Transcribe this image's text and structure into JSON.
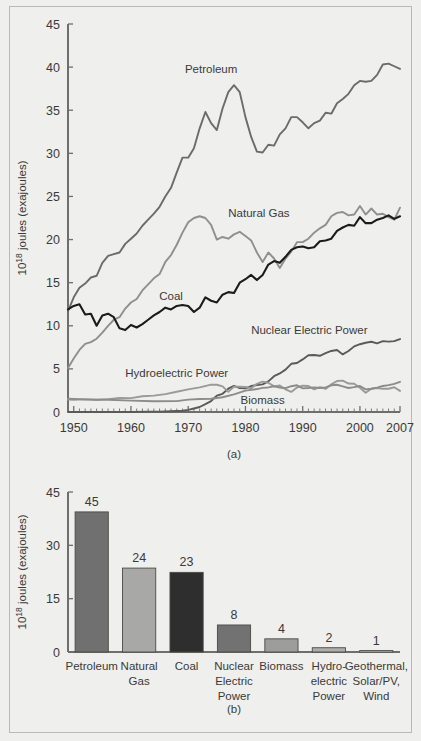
{
  "figure": {
    "background_color": "#efefed",
    "frame_color": "#b9b9b7",
    "text_color": "#3a3a38",
    "caption_a": "(a)",
    "caption_b": "(b)"
  },
  "chart_data": [
    {
      "type": "line",
      "panel": "(a)",
      "title": "",
      "xlabel": "",
      "ylabel": "10^18 joules (exajoules)",
      "ylabel_base": "10",
      "ylabel_exp": "18",
      "ylabel_rest": " joules (exajoules)",
      "xlim": [
        1949,
        2007
      ],
      "ylim": [
        0,
        45
      ],
      "yticks": [
        0,
        5,
        10,
        15,
        20,
        25,
        30,
        35,
        40,
        45
      ],
      "xticks": [
        1950,
        1960,
        1970,
        1980,
        1990,
        2000,
        2007
      ],
      "xtick_labels": [
        "1950",
        "1960",
        "1970",
        "1980",
        "1990",
        "2000",
        "2007"
      ],
      "x_minor_step": 1,
      "grid": false,
      "legend_position": "inline-annotations",
      "series": [
        {
          "name": "Petroleum",
          "color": "#6b6b69",
          "width": 1.9,
          "label_x": 1974,
          "label_y": 39.3,
          "label_anchor": "middle",
          "x": [
            1949,
            1950,
            1951,
            1952,
            1953,
            1954,
            1955,
            1956,
            1957,
            1958,
            1959,
            1960,
            1961,
            1962,
            1963,
            1964,
            1965,
            1966,
            1967,
            1968,
            1969,
            1970,
            1971,
            1972,
            1973,
            1974,
            1975,
            1976,
            1977,
            1978,
            1979,
            1980,
            1981,
            1982,
            1983,
            1984,
            1985,
            1986,
            1987,
            1988,
            1989,
            1990,
            1991,
            1992,
            1993,
            1994,
            1995,
            1996,
            1997,
            1998,
            1999,
            2000,
            2001,
            2002,
            2003,
            2004,
            2005,
            2006,
            2007
          ],
          "y": [
            11.7,
            13.3,
            14.4,
            14.9,
            15.6,
            15.8,
            17.3,
            18.1,
            18.3,
            18.5,
            19.5,
            20.1,
            20.7,
            21.6,
            22.3,
            23.0,
            23.8,
            25.0,
            26.0,
            27.8,
            29.5,
            29.5,
            30.6,
            32.9,
            34.8,
            33.5,
            32.7,
            35.2,
            37.1,
            37.9,
            37.1,
            34.2,
            31.9,
            30.2,
            30.1,
            31.0,
            30.9,
            32.2,
            32.9,
            34.2,
            34.2,
            33.6,
            32.9,
            33.5,
            33.8,
            34.7,
            34.6,
            35.8,
            36.3,
            36.9,
            37.9,
            38.4,
            38.3,
            38.4,
            39.1,
            40.3,
            40.4,
            40.1,
            39.8
          ]
        },
        {
          "name": "Natural Gas",
          "color": "#8f8f8d",
          "width": 1.9,
          "label_x": 1977,
          "label_y": 22.6,
          "label_anchor": "start",
          "x": [
            1949,
            1950,
            1951,
            1952,
            1953,
            1954,
            1955,
            1956,
            1957,
            1958,
            1959,
            1960,
            1961,
            1962,
            1963,
            1964,
            1965,
            1966,
            1967,
            1968,
            1969,
            1970,
            1971,
            1972,
            1973,
            1974,
            1975,
            1976,
            1977,
            1978,
            1979,
            1980,
            1981,
            1982,
            1983,
            1984,
            1985,
            1986,
            1987,
            1988,
            1989,
            1990,
            1991,
            1992,
            1993,
            1994,
            1995,
            1996,
            1997,
            1998,
            1999,
            2000,
            2001,
            2002,
            2003,
            2004,
            2005,
            2006,
            2007
          ],
          "y": [
            5.1,
            6.2,
            7.2,
            7.9,
            8.1,
            8.5,
            9.2,
            10.0,
            10.7,
            11.0,
            12.0,
            12.7,
            13.1,
            14.1,
            14.8,
            15.5,
            16.0,
            17.4,
            18.2,
            19.4,
            20.8,
            22.0,
            22.5,
            22.7,
            22.5,
            21.7,
            20.0,
            20.3,
            20.1,
            20.6,
            20.9,
            20.4,
            19.9,
            18.5,
            17.4,
            18.5,
            17.8,
            16.7,
            17.8,
            18.6,
            19.7,
            19.7,
            20.1,
            20.8,
            21.3,
            21.7,
            22.7,
            23.1,
            23.2,
            22.8,
            22.9,
            23.9,
            22.9,
            23.6,
            22.9,
            23.0,
            22.6,
            22.3,
            23.7
          ]
        },
        {
          "name": "Coal",
          "color": "#1b1b1b",
          "width": 2.1,
          "label_x": 1967,
          "label_y": 13.0,
          "label_anchor": "middle",
          "x": [
            1949,
            1950,
            1951,
            1952,
            1953,
            1954,
            1955,
            1956,
            1957,
            1958,
            1959,
            1960,
            1961,
            1962,
            1963,
            1964,
            1965,
            1966,
            1967,
            1968,
            1969,
            1970,
            1971,
            1972,
            1973,
            1974,
            1975,
            1976,
            1977,
            1978,
            1979,
            1980,
            1981,
            1982,
            1983,
            1984,
            1985,
            1986,
            1987,
            1988,
            1989,
            1990,
            1991,
            1992,
            1993,
            1994,
            1995,
            1996,
            1997,
            1998,
            1999,
            2000,
            2001,
            2002,
            2003,
            2004,
            2005,
            2006,
            2007
          ],
          "y": [
            11.9,
            12.3,
            12.5,
            11.3,
            11.4,
            10.0,
            11.2,
            11.4,
            11.0,
            9.7,
            9.5,
            10.1,
            9.8,
            10.2,
            10.7,
            11.2,
            11.6,
            12.1,
            11.9,
            12.3,
            12.4,
            12.3,
            11.6,
            12.1,
            13.3,
            12.9,
            12.7,
            13.6,
            13.9,
            13.8,
            15.0,
            15.4,
            15.9,
            15.3,
            15.9,
            17.1,
            17.5,
            17.3,
            18.0,
            18.8,
            19.1,
            19.2,
            19.0,
            19.1,
            19.8,
            19.9,
            20.1,
            21.0,
            21.4,
            21.7,
            21.6,
            22.6,
            21.9,
            21.9,
            22.3,
            22.5,
            22.8,
            22.4,
            22.7
          ]
        },
        {
          "name": "Nuclear Electric Power",
          "color": "#5a5a58",
          "width": 1.9,
          "label_x": 1981,
          "label_y": 9.0,
          "label_anchor": "start",
          "x": [
            1949,
            1957,
            1960,
            1963,
            1965,
            1967,
            1969,
            1970,
            1971,
            1972,
            1973,
            1974,
            1975,
            1976,
            1977,
            1978,
            1979,
            1980,
            1981,
            1982,
            1983,
            1984,
            1985,
            1986,
            1987,
            1988,
            1989,
            1990,
            1991,
            1992,
            1993,
            1994,
            1995,
            1996,
            1997,
            1998,
            1999,
            2000,
            2001,
            2002,
            2003,
            2004,
            2005,
            2006,
            2007
          ],
          "y": [
            0.0,
            0.0,
            0.0,
            0.04,
            0.04,
            0.09,
            0.15,
            0.24,
            0.41,
            0.58,
            0.91,
            1.27,
            1.9,
            2.11,
            2.7,
            3.02,
            2.78,
            2.74,
            3.01,
            3.13,
            3.2,
            3.55,
            4.15,
            4.47,
            4.91,
            5.59,
            5.68,
            6.1,
            6.58,
            6.61,
            6.52,
            6.84,
            7.08,
            7.19,
            6.68,
            7.07,
            7.61,
            7.86,
            8.03,
            8.15,
            7.96,
            8.22,
            8.16,
            8.22,
            8.46
          ]
        },
        {
          "name": "Hydroelectric Power",
          "color": "#9a9a98",
          "width": 1.9,
          "label_x": 1968,
          "label_y": 4.1,
          "label_anchor": "middle",
          "x": [
            1949,
            1950,
            1952,
            1954,
            1956,
            1958,
            1960,
            1962,
            1964,
            1966,
            1968,
            1970,
            1972,
            1974,
            1975,
            1976,
            1977,
            1978,
            1979,
            1980,
            1981,
            1982,
            1983,
            1984,
            1985,
            1986,
            1987,
            1988,
            1989,
            1990,
            1991,
            1992,
            1993,
            1994,
            1995,
            1996,
            1997,
            1998,
            1999,
            2000,
            2001,
            2002,
            2003,
            2004,
            2005,
            2006,
            2007
          ],
          "y": [
            1.43,
            1.42,
            1.46,
            1.39,
            1.49,
            1.64,
            1.61,
            1.82,
            1.9,
            2.07,
            2.35,
            2.63,
            2.86,
            3.18,
            3.16,
            2.98,
            2.33,
            2.94,
            2.93,
            2.9,
            2.76,
            3.27,
            3.53,
            3.39,
            2.97,
            3.07,
            2.63,
            2.33,
            2.84,
            3.05,
            3.02,
            2.62,
            2.89,
            2.68,
            3.21,
            3.59,
            3.64,
            3.3,
            3.27,
            2.81,
            2.24,
            2.69,
            2.78,
            2.69,
            2.7,
            2.87,
            2.45
          ]
        },
        {
          "name": "Biomass",
          "color": "#8c8c8a",
          "width": 1.9,
          "label_x": 1983,
          "label_y": 0.95,
          "label_anchor": "middle",
          "x": [
            1949,
            1952,
            1956,
            1960,
            1964,
            1968,
            1970,
            1972,
            1974,
            1976,
            1978,
            1980,
            1982,
            1983,
            1984,
            1985,
            1986,
            1987,
            1988,
            1989,
            1990,
            1991,
            1992,
            1993,
            1994,
            1995,
            1996,
            1997,
            1998,
            1999,
            2000,
            2001,
            2002,
            2003,
            2004,
            2005,
            2006,
            2007
          ],
          "y": [
            1.55,
            1.47,
            1.42,
            1.32,
            1.25,
            1.26,
            1.43,
            1.5,
            1.54,
            1.71,
            2.04,
            2.48,
            2.66,
            2.8,
            2.85,
            2.99,
            2.84,
            2.76,
            2.99,
            3.1,
            2.74,
            2.78,
            2.86,
            2.79,
            2.85,
            3.1,
            3.16,
            2.98,
            2.78,
            2.88,
            3.01,
            2.62,
            2.7,
            2.82,
            3.02,
            3.12,
            3.27,
            3.5
          ]
        }
      ]
    },
    {
      "type": "bar",
      "panel": "(b)",
      "title": "",
      "xlabel": "",
      "ylabel": "10^18 joules (exajoules)",
      "ylabel_base": "10",
      "ylabel_exp": "18",
      "ylabel_rest": " joules (exajoules)",
      "ylim": [
        0,
        45
      ],
      "yticks": [
        0,
        15,
        30,
        45
      ],
      "grid": false,
      "categories": [
        "Petroleum",
        "Natural Gas",
        "Coal",
        "Nuclear Electric Power",
        "Biomass",
        "Hydro-electric Power",
        "Geothermal, Solar/PV, Wind"
      ],
      "category_lines": [
        [
          "Petroleum"
        ],
        [
          "Natural",
          "Gas"
        ],
        [
          "Coal"
        ],
        [
          "Nuclear",
          "Electric",
          "Power"
        ],
        [
          "Biomass"
        ],
        [
          "Hydro-",
          "electric",
          "Power"
        ],
        [
          "Geothermal,",
          "Solar/PV,",
          "Wind"
        ]
      ],
      "bar_heights": [
        39.4,
        23.6,
        22.4,
        7.6,
        3.7,
        1.2,
        0.4
      ],
      "values": [
        45,
        24,
        23,
        8,
        4,
        2,
        1
      ],
      "value_labels": [
        "45",
        "24",
        "23",
        "8",
        "4",
        "2",
        "1"
      ],
      "bar_colors": [
        "#707070",
        "#a8a8a6",
        "#2e2e2e",
        "#727272",
        "#9d9d9b",
        "#adadab",
        "#c8c8c6"
      ],
      "bar_edge_color": "#4a4a48"
    }
  ]
}
